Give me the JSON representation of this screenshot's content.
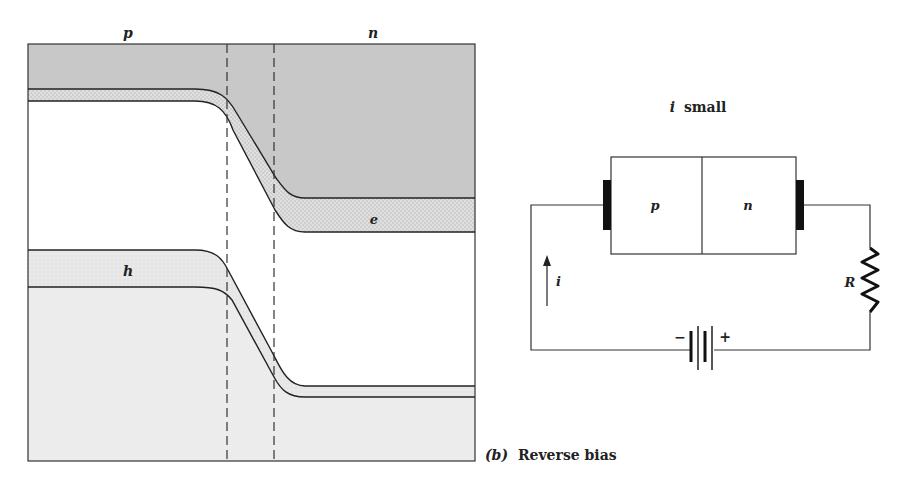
{
  "band_diagram": {
    "region_labels": {
      "p": "p",
      "n": "n"
    },
    "carrier_labels": {
      "electrons": "e",
      "holes": "h"
    },
    "colors": {
      "conduction_fill": "#c9c9c9",
      "electron_fill": "#d4d4d4",
      "hole_fill": "#ececec",
      "valence_fill": "#eeeeee",
      "line": "#222222"
    }
  },
  "circuit": {
    "title_var": "i",
    "title_text": "small",
    "diode_labels": {
      "p": "p",
      "n": "n"
    },
    "current_label": "i",
    "resistor_label": "R",
    "battery_minus": "−",
    "battery_plus": "+"
  },
  "caption": {
    "letter": "(b)",
    "text": "Reverse bias"
  }
}
